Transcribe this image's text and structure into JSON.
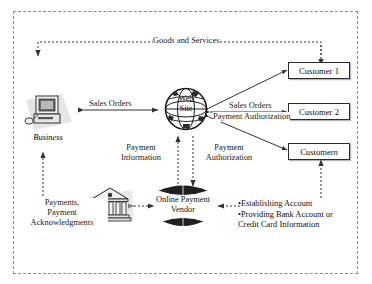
{
  "diagram": {
    "frame": {
      "style": "dashed-border"
    },
    "nodes": {
      "business": {
        "label": "Business",
        "icon": "desktop-computer-icon",
        "style": "italic"
      },
      "website": {
        "label_line1": "Web",
        "label_line2": "Site",
        "icon": "globe-icon"
      },
      "bank": {
        "label": "",
        "icon": "bank-building-icon"
      },
      "online_payment_vendor": {
        "label_line1": "Online Payment",
        "label_line2": "Vendor",
        "icon": "drum-cylinder-icon"
      },
      "customers": [
        {
          "label": "Customer 1",
          "italic_suffix": ""
        },
        {
          "label": "Customer 2",
          "italic_suffix": ""
        },
        {
          "label": "Customer ",
          "italic_suffix": "n"
        }
      ]
    },
    "flow_labels": {
      "goods_and_services": "Goods and Services",
      "sales_orders_business": "Sales Orders",
      "sales_orders_customer": "Sales Orders",
      "payment_authorization_customer": "Payment Authorization",
      "payment_information_line1": "Payment",
      "payment_information_line2": "Information",
      "payment_authorization_line1": "Payment",
      "payment_authorization_line2": "Authorization",
      "payments_line1": "Payments,",
      "payments_line2": "Payment",
      "payments_line3": "Acknowledgments",
      "account_bullet_1": "•Establishing Account",
      "account_bullet_2": "•Providing Bank Account or",
      "account_bullet_3": "Credit Card Information"
    },
    "colors": {
      "frame_border": "#8d8d8d",
      "line": "#333333",
      "dotted_line": "#333333",
      "text": "#1a1a1a",
      "box_border": "#2a2a2a",
      "background": "#ffffff"
    }
  }
}
